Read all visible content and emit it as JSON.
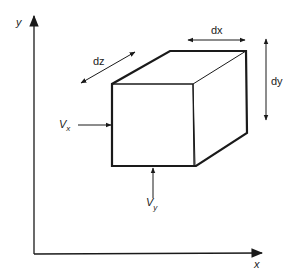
{
  "diagram": {
    "axes": {
      "x_label": "x",
      "y_label": "y"
    },
    "element": {
      "shape": "rectangular prism (cube)",
      "dimensions": {
        "dx_label": "dx",
        "dy_label": "dy",
        "dz_label": "dz"
      }
    },
    "forces": {
      "vx": {
        "symbol": "V",
        "subscript": "x"
      },
      "vy": {
        "symbol": "V",
        "subscript": "y"
      }
    },
    "colors": {
      "stroke": "#1a1a1a",
      "background": "#ffffff"
    }
  }
}
